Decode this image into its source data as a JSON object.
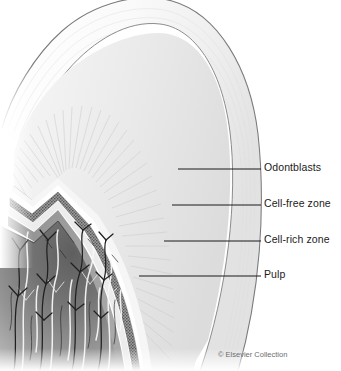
{
  "figure": {
    "width": 341,
    "height": 371,
    "background_color": "#ffffff"
  },
  "labels": [
    {
      "id": "odontoblasts",
      "text": "Odontblasts",
      "text_x": 264,
      "text_y": 165,
      "leader_x1": 178,
      "leader_x2": 261,
      "leader_y": 169
    },
    {
      "id": "cell-free-zone",
      "text": "Cell-free zone",
      "text_x": 264,
      "text_y": 201,
      "leader_x1": 172,
      "leader_x2": 261,
      "leader_y": 205
    },
    {
      "id": "cell-rich-zone",
      "text": "Cell-rich zone",
      "text_x": 264,
      "text_y": 237,
      "leader_x1": 164,
      "leader_x2": 261,
      "leader_y": 241
    },
    {
      "id": "pulp",
      "text": "Pulp",
      "text_x": 264,
      "text_y": 272,
      "leader_x1": 139,
      "leader_x2": 261,
      "leader_y": 276
    }
  ],
  "credit": {
    "text": "© Elsevier Collection"
  },
  "colors": {
    "leader_line": "#1b1b1b",
    "label_text": "#1b1b1b",
    "credit_text": "#6e6e6e",
    "enamel_light": "#fbfbfb",
    "enamel_shade": "#e9e9e9",
    "enamel_outline": "#6b6b6b",
    "dentin_light": "#f0f0f0",
    "dentin_shade": "#d6d6d6",
    "dentin_tubule": "#cfcfcf",
    "predentin": "#f4f4f4",
    "odontoblast_band": "#8a8a8a",
    "odontoblast_stipple": "#4a4a4a",
    "cell_free_zone": "#ededed",
    "cell_rich_zone": "#9a9a9a",
    "pulp_core": "#6a6a6a",
    "pulp_edge": "#b8b8b8",
    "nerve_dark": "#1e1e1e",
    "vessel_light": "#fafafa"
  },
  "anatomy": {
    "layers_outer_to_inner": [
      "Enamel",
      "Dentin",
      "Predentin",
      "Odontblasts",
      "Cell-free zone",
      "Cell-rich zone",
      "Pulp"
    ],
    "pulp_contents": [
      "nerve branches",
      "blood vessels"
    ]
  }
}
